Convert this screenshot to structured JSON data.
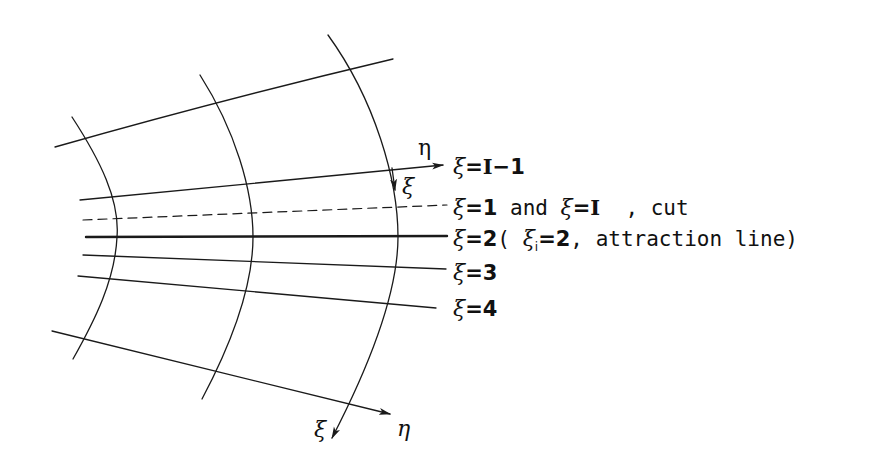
{
  "diagram": {
    "type": "curvilinear grid (C-grid cut region)",
    "stroke_color": "#1a1a1a",
    "background": "#ffffff",
    "eta_lines": [
      {
        "id": "top",
        "from": [
          55,
          147
        ],
        "to": [
          393,
          59
        ],
        "style": "solid"
      },
      {
        "id": "xi-I-minus-1",
        "from": [
          80,
          200
        ],
        "to": [
          440,
          165
        ],
        "style": "solid",
        "arrow": true
      },
      {
        "id": "xi-1-and-I-cut",
        "from": [
          83,
          220
        ],
        "to": [
          447,
          205
        ],
        "style": "dashed"
      },
      {
        "id": "xi-2-attraction",
        "from": [
          86,
          237
        ],
        "to": [
          447,
          236
        ],
        "style": "thick"
      },
      {
        "id": "xi-3",
        "from": [
          83,
          255
        ],
        "to": [
          446,
          269
        ],
        "style": "solid"
      },
      {
        "id": "xi-4",
        "from": [
          78,
          276
        ],
        "to": [
          436,
          308
        ],
        "style": "solid"
      },
      {
        "id": "bottom",
        "from": [
          52,
          331
        ],
        "to": [
          388,
          414
        ],
        "style": "solid",
        "arrow": true
      }
    ],
    "xi_curves": [
      {
        "id": "left",
        "top": [
          72,
          117
        ],
        "mid": [
          117,
          237
        ],
        "bottom": [
          73,
          359
        ]
      },
      {
        "id": "middle",
        "top": [
          200,
          75
        ],
        "mid": [
          253,
          237
        ],
        "bottom": [
          202,
          399
        ]
      },
      {
        "id": "right",
        "top": [
          328,
          35
        ],
        "mid": [
          398,
          237
        ],
        "bottom": [
          330,
          440
        ]
      }
    ]
  },
  "axes": {
    "top_eta": "η",
    "top_xi": "ξ",
    "bottom_eta": "η",
    "bottom_xi": "ξ"
  },
  "labels": {
    "row1": {
      "xi": "ξ",
      "eq": "=",
      "value": "I",
      "rest": "−1"
    },
    "row2": {
      "xi": "ξ",
      "eq": "=",
      "value": "1",
      "mid": " and ",
      "xi2": "ξ",
      "eq2": "=",
      "value2": "I",
      "rest": "  , cut"
    },
    "row3": {
      "xi": "ξ",
      "eq": "=",
      "value": "2",
      "open": "( ",
      "xi_i": "ξ",
      "sub": "i",
      "eq_i": "=2",
      "rest": ", attraction line)"
    },
    "row4": {
      "xi": "ξ",
      "eq": "=",
      "value": "3"
    },
    "row5": {
      "xi": "ξ",
      "eq": "=",
      "value": "4"
    }
  }
}
